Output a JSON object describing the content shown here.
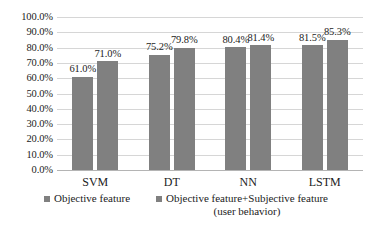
{
  "chart_data": {
    "type": "bar",
    "title": "",
    "subtitle": "",
    "xlabel": "",
    "ylabel": "",
    "categories": [
      "SVM",
      "DT",
      "NN",
      "LSTM"
    ],
    "series": [
      {
        "name": "Objective feature",
        "values": [
          61.0,
          75.2,
          80.4,
          81.5
        ],
        "labels": [
          "61.0%",
          "75.2%",
          "80.4%",
          "81.5%"
        ],
        "color": "#808080"
      },
      {
        "name": "Objective feature+Subjective feature (user behavior)",
        "values": [
          71.0,
          79.8,
          81.4,
          85.3
        ],
        "labels": [
          "71.0%",
          "79.8%",
          "81.4%",
          "85.3%"
        ],
        "color": "#808080"
      }
    ],
    "ylim": [
      0,
      100
    ],
    "ytick_values": [
      100,
      90,
      80,
      70,
      60,
      50,
      40,
      30,
      20,
      10,
      0
    ],
    "ytick_labels": [
      "100.0%",
      "90.0%",
      "80.0%",
      "70.0%",
      "60.0%",
      "50.0%",
      "40.0%",
      "30.0%",
      "20.0%",
      "10.0%",
      "0.0%"
    ],
    "grid": true,
    "legend_position": "bottom"
  },
  "legend": {
    "items": [
      {
        "label": "Objective feature",
        "line2": ""
      },
      {
        "label": "Objective feature+Subjective feature",
        "line2": "(user behavior)"
      }
    ]
  }
}
